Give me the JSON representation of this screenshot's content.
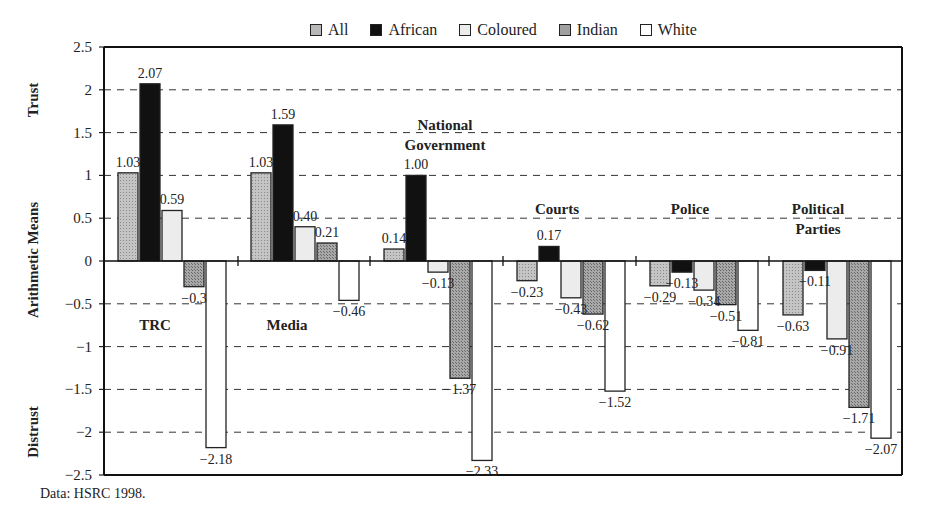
{
  "chart_data": {
    "type": "bar",
    "title": "",
    "xlabel": "",
    "ylabel": "Distrust   Arithmetic   Means   Trust",
    "ylabel_parts": {
      "top": "Trust",
      "middle": "Arithmetic   Means",
      "bottom": "Distrust"
    },
    "ylim": [
      -2.5,
      2.5
    ],
    "yticks": [
      "2.5",
      "2",
      "1.5",
      "1",
      "0.5",
      "0",
      "−0.5",
      "−1",
      "−1.5",
      "−2",
      "−2.5"
    ],
    "ytick_values": [
      2.5,
      2,
      1.5,
      1,
      0.5,
      0,
      -0.5,
      -1,
      -1.5,
      -2,
      -2.5
    ],
    "grid": "dashed horizontal",
    "legend_position": "top",
    "categories": [
      "TRC",
      "Media",
      "National Government",
      "Courts",
      "Police",
      "Political Parties"
    ],
    "category_labels": [
      {
        "lines": [
          "TRC"
        ]
      },
      {
        "lines": [
          "Media"
        ]
      },
      {
        "lines": [
          "National",
          "Government"
        ]
      },
      {
        "lines": [
          "Courts"
        ]
      },
      {
        "lines": [
          "Police"
        ]
      },
      {
        "lines": [
          "Political",
          "Parties"
        ]
      }
    ],
    "series": [
      {
        "name": "All",
        "color": "#b8b8b8",
        "pattern": "stipple",
        "values": [
          1.03,
          1.03,
          0.14,
          -0.23,
          -0.29,
          -0.63
        ],
        "labels": [
          "1.03",
          "1.03",
          "0.14",
          "−0.23",
          "−0.29",
          "−0.63"
        ]
      },
      {
        "name": "African",
        "color": "#111111",
        "pattern": "solid",
        "values": [
          2.07,
          1.59,
          1.0,
          0.17,
          -0.13,
          -0.11
        ],
        "labels": [
          "2.07",
          "1.59",
          "1.00",
          "0.17",
          "−0.13",
          "−0.11"
        ]
      },
      {
        "name": "Coloured",
        "color": "#ececec",
        "pattern": "solid",
        "values": [
          0.59,
          0.4,
          -0.13,
          -0.43,
          -0.34,
          -0.91
        ],
        "labels": [
          "0.59",
          "0.40",
          "−0.13",
          "−0.43",
          "−0.34",
          "−0.91"
        ]
      },
      {
        "name": "Indian",
        "color": "#a0a0a0",
        "pattern": "stipple",
        "values": [
          -0.3,
          0.21,
          -1.37,
          -0.62,
          -0.51,
          -1.71
        ],
        "labels": [
          "−0.3",
          "0.21",
          "−1.37",
          "−0.62",
          "−0.51",
          "−1.71"
        ]
      },
      {
        "name": "White",
        "color": "#ffffff",
        "pattern": "solid",
        "values": [
          -2.18,
          -0.46,
          -2.33,
          -1.52,
          -0.81,
          -2.07
        ],
        "labels": [
          "−2.18",
          "−0.46",
          "−2.33",
          "−1.52",
          "−0.81",
          "−2.07"
        ]
      }
    ]
  },
  "legend": {
    "items": [
      {
        "label": "All",
        "color": "#b8b8b8"
      },
      {
        "label": "African",
        "color": "#111111"
      },
      {
        "label": "Coloured",
        "color": "#ececec"
      },
      {
        "label": "Indian",
        "color": "#a0a0a0"
      },
      {
        "label": "White",
        "color": "#ffffff"
      }
    ]
  },
  "source": "Data: HSRC 1998."
}
